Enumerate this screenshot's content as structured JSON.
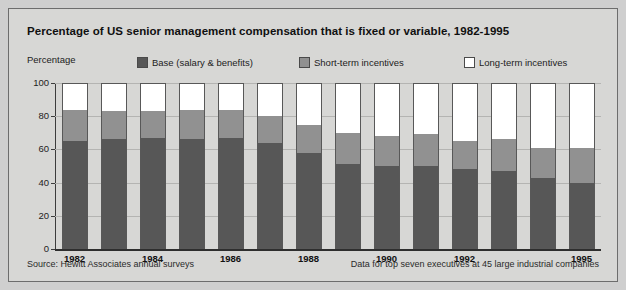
{
  "chart_data": {
    "type": "bar",
    "subtype": "stacked-column-100",
    "title": "Percentage of US senior management compensation that is fixed or variable, 1982-1995",
    "xlabel": "",
    "ylabel": "Percentage",
    "ylim": [
      0,
      100
    ],
    "yticks": [
      0,
      20,
      40,
      60,
      80,
      100
    ],
    "grid": true,
    "legend_position": "top",
    "categories": [
      "1982",
      "1983",
      "1984",
      "1985",
      "1986",
      "1987",
      "1988",
      "1989",
      "1990",
      "1991",
      "1992",
      "1993",
      "1994",
      "1995"
    ],
    "visible_tick_labels": [
      "1982",
      "1984",
      "1986",
      "1988",
      "1990",
      "1992",
      "1995"
    ],
    "series": [
      {
        "name": "Base (salary & benefits)",
        "color": "#575757",
        "values": [
          65,
          66,
          67,
          66,
          67,
          64,
          58,
          51,
          50,
          50,
          48,
          47,
          43,
          40
        ]
      },
      {
        "name": "Short-term incentives",
        "color": "#919191",
        "values": [
          19,
          17,
          16,
          18,
          17,
          16,
          17,
          19,
          18,
          19,
          17,
          19,
          18,
          21
        ]
      },
      {
        "name": "Long-term incentives",
        "color": "#ffffff",
        "values": [
          16,
          17,
          17,
          16,
          16,
          20,
          25,
          30,
          32,
          31,
          35,
          34,
          39,
          39
        ]
      }
    ],
    "source_note": "Source: Hewitt Associates annual surveys",
    "data_note": "Data for top seven executives at 45 large industrial companies"
  },
  "legend": {
    "axis_label": "Percentage",
    "items": [
      {
        "label": "Base (salary & benefits)",
        "color": "#575757"
      },
      {
        "label": "Short-term incentives",
        "color": "#919191"
      },
      {
        "label": "Long-term incentives",
        "color": "#ffffff"
      }
    ]
  },
  "footer": {
    "left": "Source: Hewitt Associates annual surveys",
    "right": "Data for top seven executives at 45 large industrial companies"
  }
}
